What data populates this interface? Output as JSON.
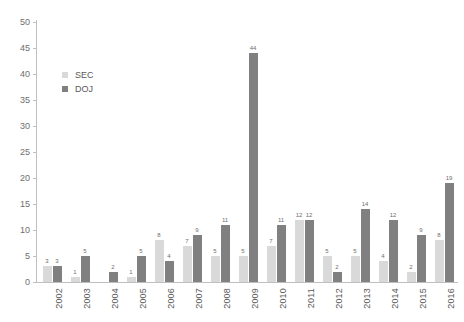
{
  "chart_data": {
    "type": "bar",
    "title": "",
    "subtitle": "",
    "xlabel": "",
    "ylabel": "",
    "categories": [
      "2002",
      "2003",
      "2004",
      "2005",
      "2006",
      "2007",
      "2008",
      "2009",
      "2010",
      "2011",
      "2012",
      "2013",
      "2014",
      "2015",
      "2016"
    ],
    "series": [
      {
        "name": "SEC",
        "color": "#d9d9d9",
        "values": [
          3,
          1,
          0,
          1,
          8,
          7,
          5,
          5,
          7,
          12,
          5,
          5,
          4,
          2,
          8
        ],
        "labels": [
          "3",
          "1",
          "",
          "1",
          "8",
          "7",
          "5",
          "5",
          "7",
          "12",
          "5",
          "5",
          "4",
          "2",
          "8"
        ]
      },
      {
        "name": "DOJ",
        "color": "#808080",
        "values": [
          3,
          5,
          2,
          5,
          4,
          9,
          11,
          44,
          11,
          12,
          2,
          14,
          12,
          9,
          19
        ],
        "labels": [
          "3",
          "5",
          "2",
          "5",
          "4",
          "9",
          "11",
          "44",
          "11",
          "12",
          "2",
          "14",
          "12",
          "9",
          "19"
        ]
      }
    ],
    "ylim": [
      0,
      50
    ],
    "yticks": [
      0,
      5,
      10,
      15,
      20,
      25,
      30,
      35,
      40,
      45,
      50
    ],
    "ytick_labels": [
      "0",
      "5",
      "10",
      "15",
      "20",
      "25",
      "30",
      "35",
      "40",
      "45",
      "50"
    ],
    "grid": false,
    "legend_position": "upper-left-inside",
    "legend": [
      "SEC",
      "DOJ"
    ]
  }
}
